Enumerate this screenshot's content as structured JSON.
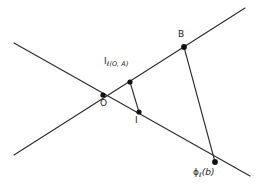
{
  "figure": {
    "width": 257,
    "height": 192,
    "background_color": "#ffffff",
    "stroke_color": "#2b2b2b",
    "point_color": "#111111"
  },
  "labels": {
    "point_O": "O",
    "point_I": "I",
    "point_B": "B",
    "point_I_ell": {
      "main": "I",
      "sub": "ℓ(O, A)"
    },
    "point_phi_ell_b": {
      "main": "ϕ",
      "sub": "ℓ",
      "arg": "(b)"
    }
  },
  "geometry": {
    "points": [
      {
        "name": "O",
        "x": 103,
        "y": 95,
        "radius": 2.6
      },
      {
        "name": "I_ell(O,A)",
        "x": 130,
        "y": 82,
        "radius": 2.6
      },
      {
        "name": "I",
        "x": 139,
        "y": 112,
        "radius": 2.6
      },
      {
        "name": "B",
        "x": 184,
        "y": 47,
        "radius": 2.9
      },
      {
        "name": "phi_ell(b)",
        "x": 215,
        "y": 162,
        "radius": 2.9
      }
    ],
    "lines": [
      {
        "name": "ascending-line",
        "x1": 14,
        "y1": 155,
        "x2": 245,
        "y2": 8
      },
      {
        "name": "descending-line",
        "x1": 14,
        "y1": 43,
        "x2": 250,
        "y2": 176
      }
    ],
    "segments": [
      {
        "name": "segment-Iell-to-I",
        "x1": 130,
        "y1": 82,
        "x2": 139,
        "y2": 112
      },
      {
        "name": "segment-B-to-phi",
        "x1": 184,
        "y1": 47,
        "x2": 215,
        "y2": 162
      }
    ]
  }
}
